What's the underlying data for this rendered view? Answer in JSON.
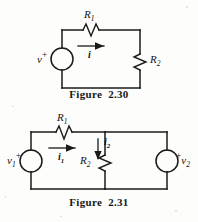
{
  "page": {
    "background_color": "#fdfdfb",
    "ink_color": "#1a1a1a",
    "width": 198,
    "height": 222
  },
  "figures": [
    {
      "id": "figure-2-30",
      "caption": "Figure  2.30",
      "description": "Single-loop circuit: voltage source v in series with resistor R1 and resistor R2",
      "elements": {
        "source_label": "v",
        "source_polarity": "+",
        "resistor_series_label": "R",
        "resistor_series_sub": "1",
        "resistor_load_label": "R",
        "resistor_load_sub": "2",
        "current_label": "i"
      }
    },
    {
      "id": "figure-2-31",
      "caption": "Figure  2.31",
      "description": "Two-mesh circuit: source v1 on left, resistor R1 on top-left branch, resistor R2 in middle branch, source v2 on right",
      "elements": {
        "source_left_label": "v",
        "source_left_sub": "1",
        "source_left_polarity": "+",
        "source_right_label": "v",
        "source_right_sub": "2",
        "source_right_polarity": "+",
        "resistor_top_label": "R",
        "resistor_top_sub": "1",
        "resistor_mid_label": "R",
        "resistor_mid_sub": "2",
        "current_left_label": "i",
        "current_left_sub": "1",
        "current_mid_label": "i",
        "current_mid_sub": "2"
      }
    }
  ]
}
